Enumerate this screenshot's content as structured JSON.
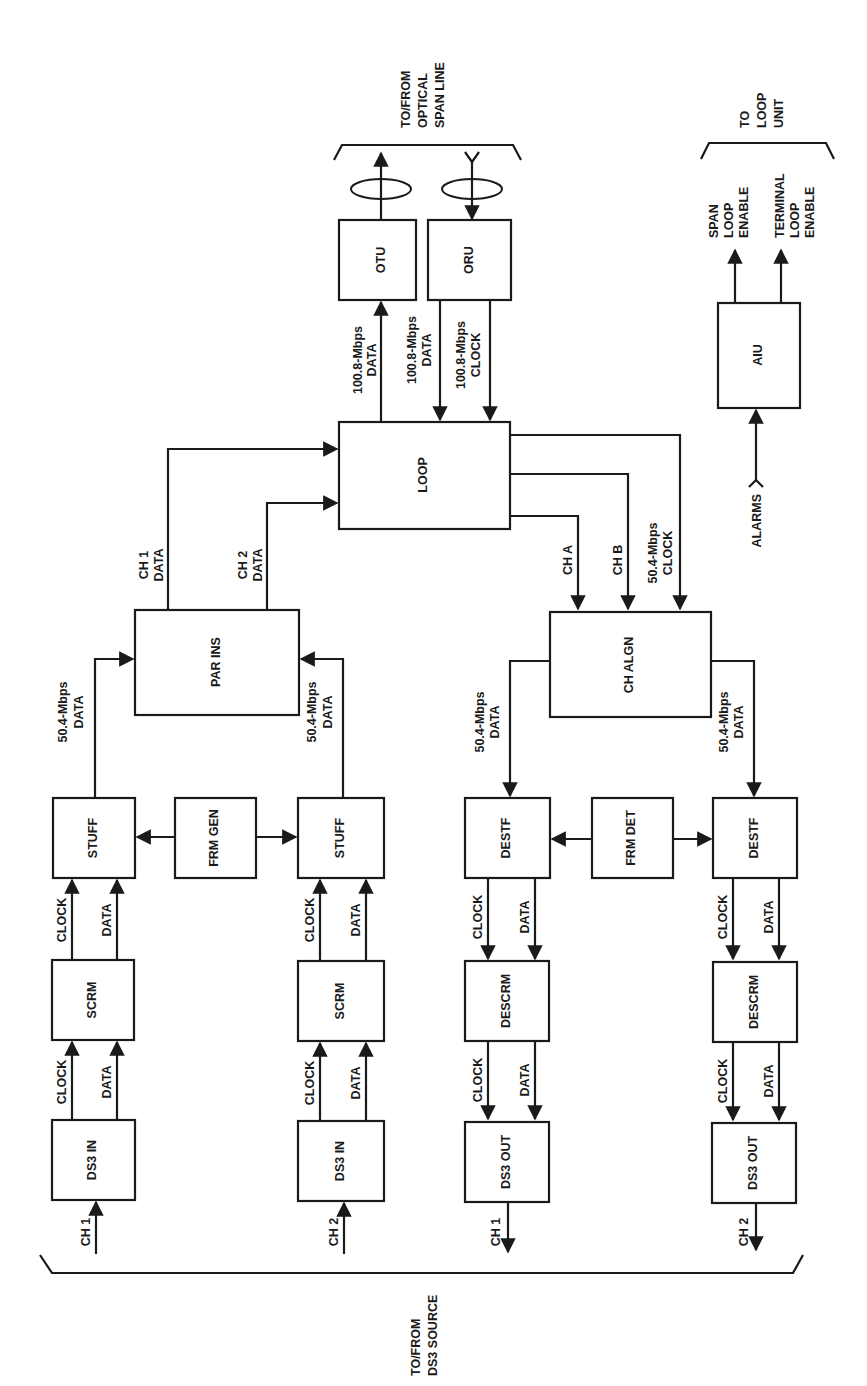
{
  "diagram": {
    "colors": {
      "ink": "#1a1a1a",
      "background": "#ffffff"
    },
    "groups": {
      "optical": {
        "label": [
          "TO/FROM",
          "OPTICAL",
          "SPAN LINE"
        ]
      },
      "loop_unit": {
        "label": [
          "TO",
          "LOOP",
          "UNIT"
        ]
      },
      "ds3_source": {
        "label": [
          "TO/FROM",
          "DS3 SOURCE"
        ]
      }
    },
    "blocks": {
      "otu": "OTU",
      "oru": "ORU",
      "loop": "LOOP",
      "aiu": "AIU",
      "par_ins": "PAR INS",
      "ch_algn": "CH ALGN",
      "stuff_1": "STUFF",
      "stuff_2": "STUFF",
      "frm_gen": "FRM GEN",
      "scrm_1": "SCRM",
      "scrm_2": "SCRM",
      "ds3_in_1": "DS3 IN",
      "ds3_in_2": "DS3 IN",
      "destf_1": "DESTF",
      "destf_2": "DESTF",
      "frm_det": "FRM DET",
      "descrm_1": "DESCRM",
      "descrm_2": "DESCRM",
      "ds3_out_1": "DS3 OUT",
      "ds3_out_2": "DS3 OUT"
    },
    "signals": {
      "otu_in": [
        "100.8-Mbps",
        "DATA"
      ],
      "oru_data": [
        "100.8-Mbps",
        "DATA"
      ],
      "oru_clock": [
        "100.8-Mbps",
        "CLOCK"
      ],
      "ch1_data": [
        "CH 1",
        "DATA"
      ],
      "ch2_data": [
        "CH 2",
        "DATA"
      ],
      "ch_a": "CH A",
      "ch_b": "CH B",
      "loop_clock": [
        "50.4-Mbps",
        "CLOCK"
      ],
      "stuff1_out": [
        "50.4-Mbps",
        "DATA"
      ],
      "stuff2_out": [
        "50.4-Mbps",
        "DATA"
      ],
      "algn_out1": [
        "50.4-Mbps",
        "DATA"
      ],
      "algn_out2": [
        "50.4-Mbps",
        "DATA"
      ],
      "clock": "CLOCK",
      "data": "DATA",
      "ch1": "CH 1",
      "ch2": "CH 2",
      "alarms": "ALARMS",
      "span_loop_enable": [
        "SPAN",
        "LOOP",
        "ENABLE"
      ],
      "terminal_loop_enable": [
        "TERMINAL",
        "LOOP",
        "ENABLE"
      ]
    }
  }
}
